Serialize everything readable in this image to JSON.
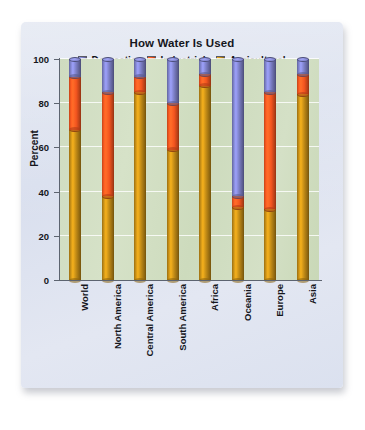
{
  "chart_data": {
    "type": "bar",
    "subtype": "stacked-column-3d",
    "title": "How Water Is Used",
    "xlabel": "",
    "ylabel": "Percent",
    "ylim": [
      0,
      100
    ],
    "yticks": [
      0,
      20,
      40,
      60,
      80,
      100
    ],
    "grid": true,
    "legend_position": "top",
    "stacked_total": 100,
    "categories": [
      "World",
      "North America",
      "Central America",
      "South America",
      "Africa",
      "Oceania",
      "Europe",
      "Asia"
    ],
    "series": [
      {
        "name": "Agricultural",
        "color": "#c08a16",
        "values": [
          68,
          38,
          85,
          59,
          88,
          33,
          32,
          84
        ]
      },
      {
        "name": "Industrial",
        "color": "#f4551f",
        "values": [
          24,
          47,
          7,
          21,
          5,
          5,
          53,
          9
        ]
      },
      {
        "name": "Domestic",
        "color": "#7b7ec4",
        "values": [
          8,
          15,
          8,
          20,
          7,
          62,
          15,
          7
        ]
      }
    ],
    "stack_order_bottom_to_top": [
      "Agricultural",
      "Industrial",
      "Domestic"
    ],
    "cumulative_tops": {
      "World": {
        "agricultural": 68,
        "industrial": 92,
        "domestic": 100
      },
      "North America": {
        "agricultural": 38,
        "industrial": 85,
        "domestic": 100
      },
      "Central America": {
        "agricultural": 85,
        "industrial": 92,
        "domestic": 100
      },
      "South America": {
        "agricultural": 59,
        "industrial": 80,
        "domestic": 100
      },
      "Africa": {
        "agricultural": 88,
        "industrial": 93,
        "domestic": 100
      },
      "Oceania": {
        "agricultural": 33,
        "industrial": 38,
        "domestic": 100
      },
      "Europe": {
        "agricultural": 32,
        "industrial": 85,
        "domestic": 100
      },
      "Asia": {
        "agricultural": 84,
        "industrial": 93,
        "domestic": 100
      }
    }
  },
  "legend": [
    {
      "label": "Domestic",
      "color": "#7b7ec4"
    },
    {
      "label": "Industrial",
      "color": "#f4551f"
    },
    {
      "label": "Agricultural",
      "color": "#c08a16"
    }
  ],
  "colors": {
    "card_background": "#dfe4f0",
    "plot_background": "#d2dfc3",
    "gridline": "#ffffff",
    "axis": "#5d6470",
    "text": "#15161c",
    "domestic": "#7b7ec4",
    "industrial": "#f4551f",
    "agricultural": "#c08a16"
  }
}
